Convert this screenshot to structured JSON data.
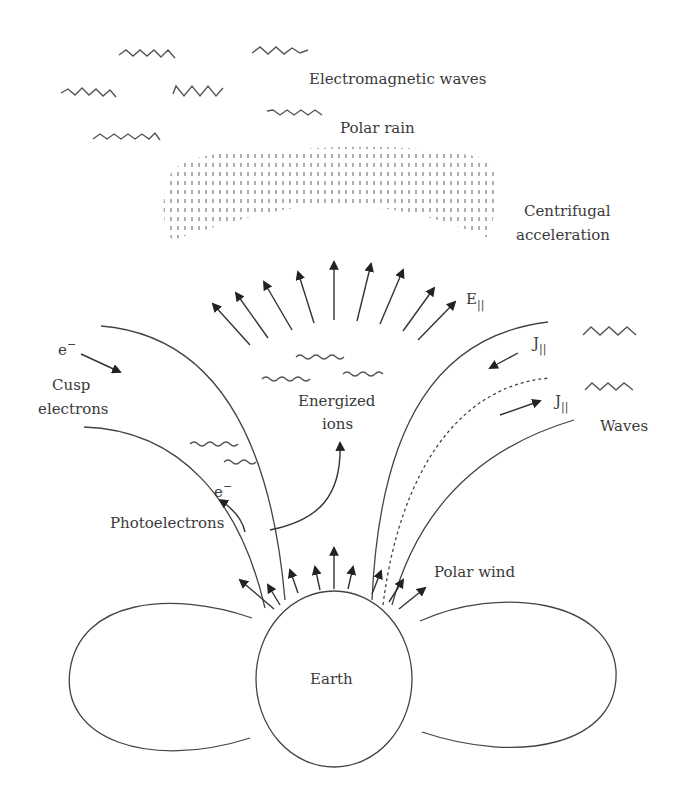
{
  "diagram": {
    "type": "schematic",
    "labels": {
      "em_waves": "Electromagnetic waves",
      "polar_rain": "Polar rain",
      "centrifugal_1": "Centrifugal",
      "centrifugal_2": "acceleration",
      "e_parallel": "E",
      "e_parallel_sub": "||",
      "e_minus_top": "e",
      "e_minus_top_sup": "−",
      "cusp_1": "Cusp",
      "cusp_2": "electrons",
      "energized_1": "Energized",
      "energized_2": "ions",
      "j_parallel_1": "J",
      "j_parallel_1_sub": "||",
      "j_parallel_2": "J",
      "j_parallel_2_sub": "||",
      "waves": "Waves",
      "e_minus_photo": "e",
      "e_minus_photo_sup": "−",
      "photoelectrons": "Photoelectrons",
      "polar_wind": "Polar wind",
      "earth": "Earth"
    },
    "elements": [
      "electromagnetic-wave squiggles (7)",
      "polar rain stippled region",
      "centrifugal acceleration fan of 9 upward arrows",
      "open magnetic field lines (left pair, right pair + dashed)",
      "small sinusoidal waves (energized ion region)",
      "polar wind arrows (9) from Earth's surface",
      "Earth circle with two closed-field-line lobes"
    ]
  }
}
